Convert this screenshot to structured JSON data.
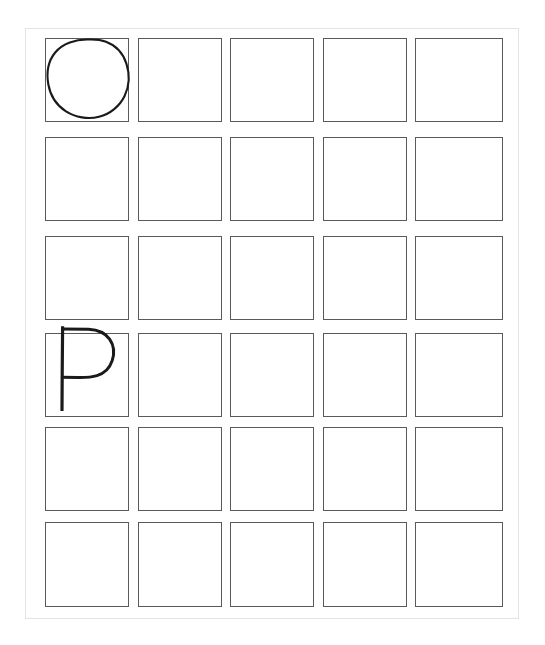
{
  "page": {
    "background_color": "#ffffff",
    "border_color": "#e3e3e3",
    "ink_color": "#1a1a1a",
    "cell_border_color": "#5a5a5a"
  },
  "grid": {
    "columns": 5,
    "rows": 6,
    "cell_width": 84,
    "cell_height": 84,
    "column_lefts": [
      45,
      138,
      230,
      323,
      415
    ],
    "row_tops": [
      38,
      137,
      236,
      333,
      427,
      522
    ],
    "total_cells": 30
  },
  "glyphs": [
    {
      "id": "glyph-circle",
      "name": "letter-o",
      "label": "O",
      "row": 0,
      "col": 0,
      "description": "hand-drawn circle filling the cell"
    },
    {
      "id": "glyph-p",
      "name": "letter-p",
      "label": "P",
      "row": 3,
      "col": 0,
      "description": "hand-drawn capital P with tall stem and upper bowl"
    }
  ],
  "empty_cells_count": 28
}
